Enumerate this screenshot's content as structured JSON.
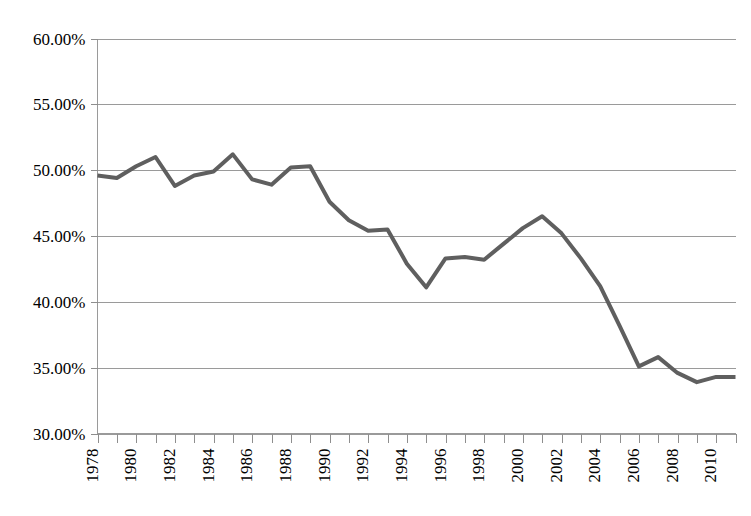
{
  "chart_data": {
    "type": "line",
    "title": "",
    "subtitle": "",
    "xlabel": "",
    "ylabel": "",
    "grid": true,
    "legend": false,
    "legend_position": "none",
    "line_color": "#5f5f5f",
    "background_color": "#ffffff",
    "grid_color": "#9a9a9a",
    "axis_color": "#9a9a9a",
    "ylim": [
      30,
      60
    ],
    "ytick_values": [
      30,
      35,
      40,
      45,
      50,
      55,
      60
    ],
    "ytick_labels": [
      "30.00%",
      "35.00%",
      "40.00%",
      "45.00%",
      "50.00%",
      "55.00%",
      "60.00%"
    ],
    "ytick_format": "percent-2dp",
    "xlim": [
      1978,
      2011
    ],
    "x": [
      1978,
      1979,
      1980,
      1981,
      1982,
      1983,
      1984,
      1985,
      1986,
      1987,
      1988,
      1989,
      1990,
      1991,
      1992,
      1993,
      1994,
      1995,
      1996,
      1997,
      1998,
      1999,
      2000,
      2001,
      2002,
      2003,
      2004,
      2005,
      2006,
      2007,
      2008,
      2009,
      2010,
      2011
    ],
    "xtick_values": [
      1978,
      1979,
      1980,
      1981,
      1982,
      1983,
      1984,
      1985,
      1986,
      1987,
      1988,
      1989,
      1990,
      1991,
      1992,
      1993,
      1994,
      1995,
      1996,
      1997,
      1998,
      1999,
      2000,
      2001,
      2002,
      2003,
      2004,
      2005,
      2006,
      2007,
      2008,
      2009,
      2010,
      2011
    ],
    "xtick_labels": [
      "1978",
      "",
      "1980",
      "",
      "1982",
      "",
      "1984",
      "",
      "1986",
      "",
      "1988",
      "",
      "1990",
      "",
      "1992",
      "",
      "1994",
      "",
      "1996",
      "",
      "1998",
      "",
      "2000",
      "",
      "2002",
      "",
      "2004",
      "",
      "2006",
      "",
      "2008",
      "",
      "2010",
      ""
    ],
    "xtick_label_rotation": -90,
    "values": [
      49.6,
      49.4,
      50.3,
      51.0,
      48.8,
      49.6,
      49.9,
      51.2,
      49.3,
      48.9,
      50.2,
      50.3,
      47.6,
      46.2,
      45.4,
      45.5,
      42.9,
      41.1,
      43.3,
      43.4,
      43.2,
      44.4,
      45.6,
      46.5,
      45.2,
      43.3,
      41.2,
      38.2,
      35.1,
      35.8,
      34.6,
      33.9,
      34.3,
      34.3
    ],
    "series": [
      {
        "name": "",
        "values": [
          49.6,
          49.4,
          50.3,
          51.0,
          48.8,
          49.6,
          49.9,
          51.2,
          49.3,
          48.9,
          50.2,
          50.3,
          47.6,
          46.2,
          45.4,
          45.5,
          42.9,
          41.1,
          43.3,
          43.4,
          43.2,
          44.4,
          45.6,
          46.5,
          45.2,
          43.3,
          41.2,
          38.2,
          35.1,
          35.8,
          34.6,
          33.9,
          34.3,
          34.3
        ]
      }
    ],
    "annotations": []
  }
}
